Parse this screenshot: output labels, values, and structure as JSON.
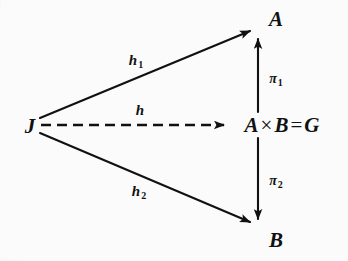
{
  "figure": {
    "kind": "commutative-diagram",
    "background_color": "#fbfbfb",
    "ink_color": "#111111",
    "width": 348,
    "height": 261
  },
  "nodes": {
    "source": {
      "label": "J",
      "x": 30,
      "y": 126
    },
    "top": {
      "label": "A",
      "x": 276,
      "y": 19
    },
    "bottom": {
      "label": "B",
      "x": 276,
      "y": 240
    },
    "product": {
      "left_factor": "A",
      "times_sign": "×",
      "right_factor": "B",
      "equals_sign": "=",
      "result": "G",
      "full_label": "A × B = G",
      "x": 282,
      "y": 125
    }
  },
  "edges": [
    {
      "name": "h1",
      "base": "h",
      "subscript": "1",
      "style": "solid",
      "from": "J",
      "to": "A",
      "label_x": 136,
      "label_y": 61,
      "x1": 40,
      "y1": 118,
      "x2": 250,
      "y2": 31
    },
    {
      "name": "h",
      "base": "h",
      "subscript": "",
      "style": "dashed",
      "from": "J",
      "to": "A × B = G",
      "label_x": 140,
      "label_y": 110,
      "x1": 41,
      "y1": 125,
      "x2": 224,
      "y2": 125
    },
    {
      "name": "h2",
      "base": "h",
      "subscript": "2",
      "style": "solid",
      "from": "J",
      "to": "B",
      "label_x": 139,
      "label_y": 192,
      "x1": 40,
      "y1": 133,
      "x2": 250,
      "y2": 222
    },
    {
      "name": "pi1",
      "base": "π",
      "subscript": "1",
      "style": "solid",
      "from": "A × B = G",
      "to": "A",
      "label_x": 276,
      "label_y": 79,
      "x1": 258,
      "y1": 112,
      "x2": 258,
      "y2": 39
    },
    {
      "name": "pi2",
      "base": "π",
      "subscript": "2",
      "style": "solid",
      "from": "A × B = G",
      "to": "B",
      "label_x": 276,
      "label_y": 181,
      "x1": 258,
      "y1": 138,
      "x2": 258,
      "y2": 219
    }
  ]
}
